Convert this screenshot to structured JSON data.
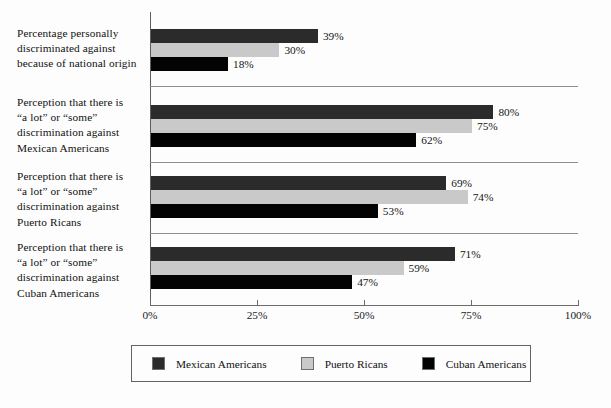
{
  "chart_data": {
    "type": "bar",
    "orientation": "horizontal",
    "title": "",
    "xlabel": "",
    "ylabel": "",
    "xlim": [
      0,
      100
    ],
    "xticks": [
      "0%",
      "25%",
      "50%",
      "75%",
      "100%"
    ],
    "xtick_values": [
      0,
      25,
      50,
      75,
      100
    ],
    "grid": false,
    "legend_position": "bottom",
    "categories": [
      "Percentage personally discriminated against because of national origin",
      "Perception that there is “a lot” or “some” discrimination against Mexican Americans",
      "Perception that there is “a lot” or “some” discrimination against Puerto Ricans",
      "Perception that there is “a lot” or “some” discrimination against Cuban Americans"
    ],
    "category_lines": [
      [
        "Percentage personally",
        "discriminated against",
        "because of national origin"
      ],
      [
        "Perception that there is",
        "“a lot” or “some”",
        "discrimination against",
        "Mexican Americans"
      ],
      [
        "Perception that there is",
        "“a lot” or “some”",
        "discrimination against",
        "Puerto Ricans"
      ],
      [
        "Perception that there is",
        "“a lot” or “some”",
        "discrimination against",
        "Cuban Americans"
      ]
    ],
    "series": [
      {
        "name": "Mexican Americans",
        "color": "#2b2b2b",
        "values": [
          39,
          80,
          69,
          71
        ],
        "labels": [
          "39%",
          "80%",
          "69%",
          "71%"
        ]
      },
      {
        "name": "Puerto Ricans",
        "color": "#c9c9c9",
        "values": [
          30,
          75,
          74,
          59
        ],
        "labels": [
          "30%",
          "75%",
          "74%",
          "59%"
        ]
      },
      {
        "name": "Cuban Americans",
        "color": "#030303",
        "values": [
          18,
          62,
          53,
          47
        ],
        "labels": [
          "18%",
          "62%",
          "53%",
          "47%"
        ]
      }
    ]
  },
  "legend": {
    "items": [
      {
        "label": "Mexican Americans",
        "color": "#2b2b2b"
      },
      {
        "label": "Puerto Ricans",
        "color": "#c9c9c9"
      },
      {
        "label": "Cuban Americans",
        "color": "#030303"
      }
    ]
  }
}
